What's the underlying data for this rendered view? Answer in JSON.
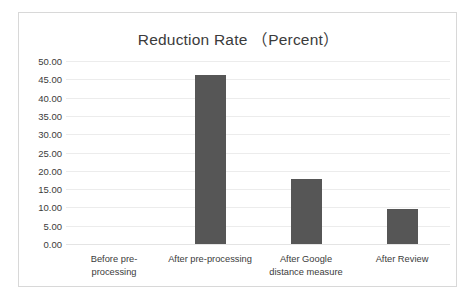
{
  "chart_data": {
    "type": "bar",
    "title": "Reduction Rate （Percent）",
    "xlabel": "",
    "ylabel": "",
    "categories": [
      "Before pre-processing",
      "After pre-processing",
      "After Google distance measure",
      "After Review"
    ],
    "category_lines": [
      [
        "Before pre-",
        "processing"
      ],
      [
        "After pre-processing"
      ],
      [
        "After Google",
        "distance measure"
      ],
      [
        "After Review"
      ]
    ],
    "values": [
      0,
      46.1,
      17.7,
      9.6
    ],
    "ylim": [
      0,
      50
    ],
    "ytick_step": 5,
    "ytick_labels": [
      "50.00",
      "45.00",
      "40.00",
      "35.00",
      "30.00",
      "25.00",
      "20.00",
      "15.00",
      "10.00",
      "5.00",
      "0.00"
    ],
    "ytick_values": [
      50,
      45,
      40,
      35,
      30,
      25,
      20,
      15,
      10,
      5,
      0
    ],
    "grid": true,
    "legend": false,
    "legend_position": "none",
    "colors": {
      "bar": "#565656",
      "gridline": "#ececec",
      "border": "#d8d8d8",
      "text": "#3b3b3b",
      "background": "#ffffff"
    }
  }
}
